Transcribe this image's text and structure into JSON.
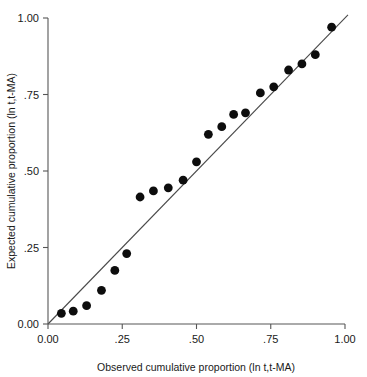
{
  "chart_data": {
    "type": "scatter",
    "title": "",
    "subtitle": "",
    "xlabel": "Observed cumulative proportion (ln t,t-MA)",
    "ylabel": "Expected cumulative proportion (ln t,t-MA)",
    "xlim": [
      0.0,
      1.0
    ],
    "ylim": [
      0.0,
      1.0
    ],
    "grid": false,
    "legend": null,
    "xticks": [
      {
        "value": 0.0,
        "label": "0.00"
      },
      {
        "value": 0.25,
        "label": ".25"
      },
      {
        "value": 0.5,
        "label": ".50"
      },
      {
        "value": 0.75,
        "label": ".75"
      },
      {
        "value": 1.0,
        "label": "1.00"
      }
    ],
    "yticks": [
      {
        "value": 0.0,
        "label": "0.00"
      },
      {
        "value": 0.25,
        "label": ".25"
      },
      {
        "value": 0.5,
        "label": ".50"
      },
      {
        "value": 0.75,
        "label": ".75"
      },
      {
        "value": 1.0,
        "label": "1.00"
      }
    ],
    "series": [
      {
        "name": "observed-vs-expected",
        "marker": "filled-circle",
        "marker_color": "#0d0d0d",
        "marker_size": 6.2,
        "x": [
          0.045,
          0.085,
          0.13,
          0.18,
          0.225,
          0.265,
          0.31,
          0.355,
          0.405,
          0.455,
          0.5,
          0.54,
          0.585,
          0.625,
          0.665,
          0.715,
          0.76,
          0.81,
          0.855,
          0.9,
          0.955
        ],
        "y": [
          0.035,
          0.042,
          0.06,
          0.11,
          0.175,
          0.23,
          0.415,
          0.435,
          0.445,
          0.47,
          0.53,
          0.62,
          0.645,
          0.685,
          0.69,
          0.755,
          0.775,
          0.83,
          0.85,
          0.88,
          0.97
        ]
      }
    ],
    "reference_line": {
      "name": "identity-line",
      "description": "y = x diagonal reference line",
      "from": [
        0.0,
        0.0
      ],
      "to": [
        1.01,
        1.01
      ],
      "color": "#4a4a4a"
    },
    "colors": {
      "background": "#ffffff",
      "axis": "#565656",
      "text": "#1a1a1a",
      "marker": "#0d0d0d",
      "reference_line": "#4a4a4a"
    }
  }
}
